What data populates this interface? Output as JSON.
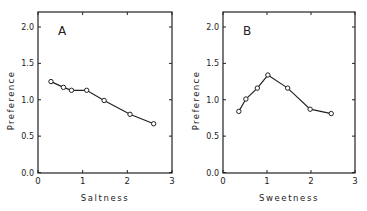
{
  "figure": {
    "background": "#ffffff",
    "ink_color": "#222222"
  },
  "chart_data": [
    {
      "type": "line",
      "panel_label": "A",
      "title": "",
      "xlabel": "Saltness",
      "ylabel": "Preference",
      "xlim": [
        0,
        3
      ],
      "ylim": [
        0,
        2.2
      ],
      "xticks": [
        "0",
        "1",
        "2",
        "3"
      ],
      "yticks": [
        "0.0",
        "0.5",
        "1.0",
        "1.5",
        "2.0"
      ],
      "grid": false,
      "legend": null,
      "marker": "open-circle",
      "series": [
        {
          "name": "Saltness preference",
          "x": [
            0.29,
            0.57,
            0.75,
            1.09,
            1.48,
            2.06,
            2.59
          ],
          "y": [
            1.25,
            1.17,
            1.13,
            1.13,
            0.99,
            0.8,
            0.67
          ]
        }
      ]
    },
    {
      "type": "line",
      "panel_label": "B",
      "title": "",
      "xlabel": "Sweetness",
      "ylabel": "Preference",
      "xlim": [
        0,
        3
      ],
      "ylim": [
        0,
        2.2
      ],
      "xticks": [
        "0",
        "1",
        "2",
        "3"
      ],
      "yticks": [
        "0.0",
        "0.5",
        "1.0",
        "1.5",
        "2.0"
      ],
      "grid": false,
      "legend": null,
      "marker": "open-circle",
      "series": [
        {
          "name": "Sweetness preference",
          "x": [
            0.36,
            0.52,
            0.78,
            1.02,
            1.47,
            1.98,
            2.46
          ],
          "y": [
            0.84,
            1.01,
            1.16,
            1.34,
            1.16,
            0.87,
            0.81
          ]
        }
      ]
    }
  ]
}
